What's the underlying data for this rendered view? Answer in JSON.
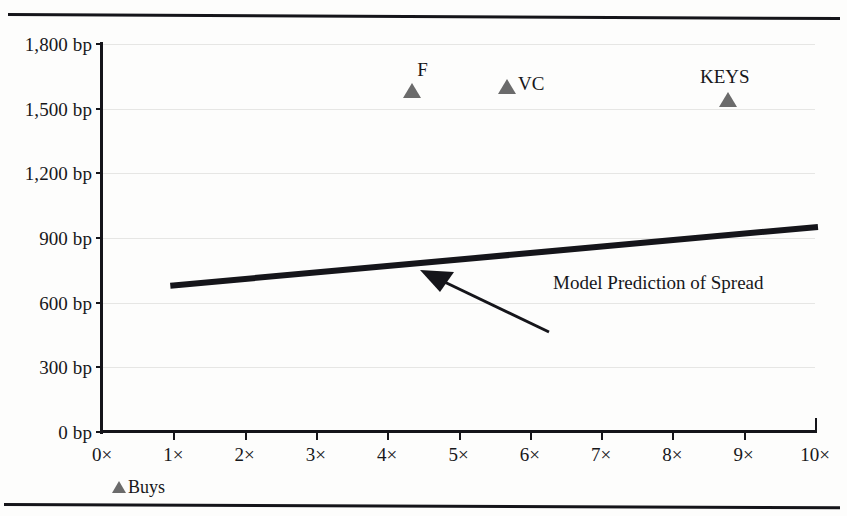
{
  "chart_data": {
    "type": "scatter",
    "title": "",
    "xlabel": "",
    "ylabel": "",
    "xlim": [
      0,
      10
    ],
    "ylim": [
      0,
      1800
    ],
    "grid": true,
    "legend_position": "bottom-left",
    "x_tick_labels": [
      "0×",
      "1×",
      "2×",
      "3×",
      "4×",
      "5×",
      "6×",
      "7×",
      "8×",
      "9×",
      "10×"
    ],
    "x_tick_values": [
      0,
      1,
      2,
      3,
      4,
      5,
      6,
      7,
      8,
      9,
      10
    ],
    "y_tick_labels": [
      "0 bp",
      "300 bp",
      "600 bp",
      "900 bp",
      "1,200 bp",
      "1,500 bp",
      "1,800 bp"
    ],
    "y_tick_values": [
      0,
      300,
      600,
      900,
      1200,
      1500,
      1800
    ],
    "series": [
      {
        "name": "Buys",
        "type": "scatter",
        "marker": "triangle",
        "color": "#6b6b6b",
        "points": [
          {
            "label": "F",
            "x": 4.35,
            "y": 1580,
            "label_position": "above-right"
          },
          {
            "label": "VC",
            "x": 5.68,
            "y": 1600,
            "label_position": "right"
          },
          {
            "label": "KEYS",
            "x": 8.78,
            "y": 1540,
            "label_position": "above"
          }
        ]
      },
      {
        "name": "Model Prediction of Spread",
        "type": "line",
        "color": "#15151a",
        "x": [
          1,
          10
        ],
        "values": [
          680,
          950
        ]
      }
    ],
    "annotations": [
      {
        "text": "Model Prediction of Spread",
        "arrow_from": {
          "x": 7.0,
          "y": 600
        },
        "arrow_to": {
          "x": 4.55,
          "y": 755
        }
      }
    ],
    "legend_entries": [
      {
        "label": "Buys",
        "marker": "triangle",
        "color": "#6b6b6b"
      }
    ]
  },
  "colors": {
    "ink": "#15151a",
    "marker": "#6b6b6b",
    "gridline": "#e6e6e4",
    "paper": "#fdfdfc"
  }
}
